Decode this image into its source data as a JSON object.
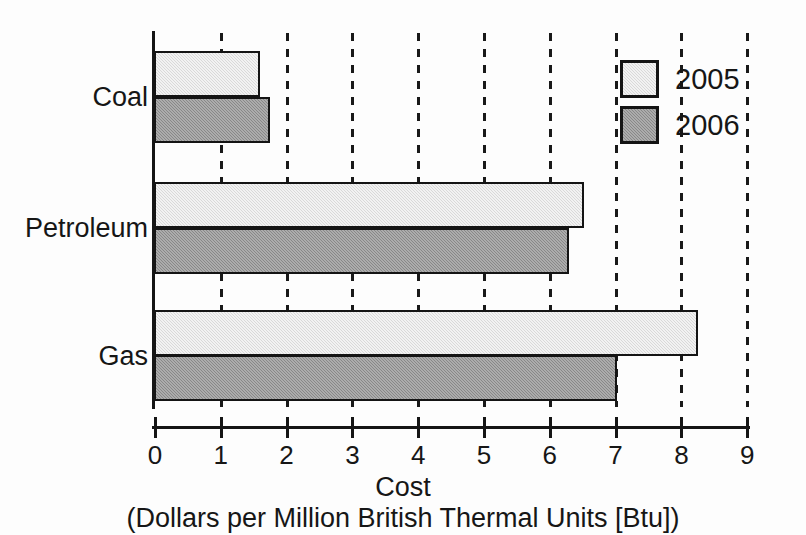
{
  "chart_data": {
    "type": "bar",
    "orientation": "horizontal",
    "title": "",
    "xlabel": "Cost",
    "xlabel_sub": "(Dollars per Million British Thermal Units [Btu])",
    "ylabel": "",
    "categories": [
      "Coal",
      "Petroleum",
      "Gas"
    ],
    "series": [
      {
        "name": "2005",
        "color": "#d9d9d9",
        "values": [
          1.58,
          6.5,
          8.23
        ]
      },
      {
        "name": "2006",
        "color": "#888888",
        "values": [
          1.73,
          6.28,
          7.0
        ]
      }
    ],
    "xlim": [
      0,
      9
    ],
    "xticks": [
      0,
      1,
      2,
      3,
      4,
      5,
      6,
      7,
      8,
      9
    ],
    "xtick_labels": [
      "0",
      "1",
      "2",
      "3",
      "4",
      "5",
      "6",
      "7",
      "8",
      "9"
    ],
    "grid": true,
    "grid_style": "dashed-vertical",
    "legend_position": "top-right"
  },
  "legend": {
    "entries": [
      {
        "label": "2005"
      },
      {
        "label": "2006"
      }
    ]
  }
}
